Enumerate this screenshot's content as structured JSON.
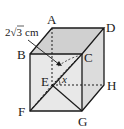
{
  "figure": {
    "type": "cube",
    "vertices": {
      "A": {
        "label": "A"
      },
      "B": {
        "label": "B"
      },
      "C": {
        "label": "C"
      },
      "D": {
        "label": "D"
      },
      "E": {
        "label": "E"
      },
      "F": {
        "label": "F"
      },
      "G": {
        "label": "G"
      },
      "H": {
        "label": "H"
      }
    },
    "dimension_label": "2√3 cm",
    "dimension_prefix": "2",
    "dimension_radical": "3",
    "dimension_unit": "cm",
    "angle_label": "x",
    "colors": {
      "edge": "#1a1a1a",
      "top_face": "#cfcfcf",
      "front_face": "#e6e6e6",
      "side_face": "#d9d9d9"
    }
  }
}
